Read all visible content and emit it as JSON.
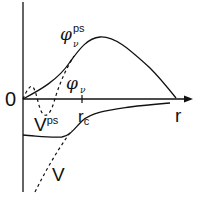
{
  "diagram": {
    "axes": {
      "origin_label": "0",
      "x_label": "r",
      "cutoff_label": "r",
      "cutoff_subscript": "c"
    },
    "curves": {
      "pseudo_wavefunction": {
        "symbol": "φ",
        "superscript": "ps",
        "subscript": "ν",
        "style": "solid"
      },
      "all_electron_wavefunction": {
        "symbol": "φ",
        "subscript": "ν",
        "style": "dashed"
      },
      "pseudopotential": {
        "symbol": "V",
        "superscript": "ps",
        "style": "solid"
      },
      "true_potential": {
        "symbol": "V",
        "style": "dashed"
      }
    },
    "colors": {
      "line": "#111111",
      "background": "#ffffff"
    }
  }
}
